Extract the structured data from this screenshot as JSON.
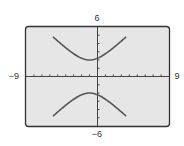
{
  "chart_data": {
    "type": "line",
    "title": "",
    "xlabel": "",
    "ylabel": "",
    "xlim": [
      -9,
      9
    ],
    "ylim": [
      -6,
      6
    ],
    "grid": false,
    "legend": null,
    "x_tick_step": 1,
    "y_tick_step": 1,
    "window_labels": {
      "xmin": "−9",
      "xmax": "9",
      "ymin": "−6",
      "ymax": "6"
    },
    "series": [
      {
        "name": "hyperbola-upper-branch",
        "description": "Upper branch of vertical hyperbola, vertex near (-1, 2)",
        "x": [
          -5.5,
          -4.5,
          -3.5,
          -2.5,
          -1.5,
          -1,
          -0.5,
          0.5,
          1.5,
          2.5,
          3.5
        ],
        "y": [
          6.0,
          5.0,
          4.0,
          3.0,
          2.1,
          2.0,
          2.1,
          3.0,
          4.0,
          5.0,
          6.0
        ]
      },
      {
        "name": "hyperbola-lower-branch",
        "description": "Lower branch of vertical hyperbola, vertex near (-1, -2)",
        "x": [
          -5.5,
          -4.5,
          -3.5,
          -2.5,
          -1.5,
          -1,
          -0.5,
          0.5,
          1.5,
          2.5,
          3.5
        ],
        "y": [
          -6.0,
          -5.0,
          -4.0,
          -3.0,
          -2.1,
          -2.0,
          -2.1,
          -3.0,
          -4.0,
          -5.0,
          -6.0
        ]
      }
    ],
    "colors": {
      "curve": "#555555",
      "frame": "#333333",
      "background": "#e6e6e6",
      "axes": "#444444"
    }
  }
}
